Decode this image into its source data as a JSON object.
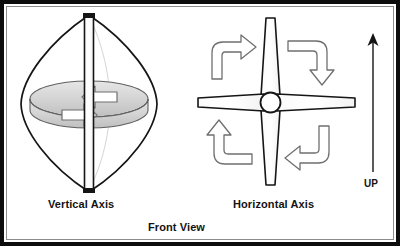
{
  "figure": {
    "background_color": "#ffffff",
    "frame_color": "#0d0d0d",
    "inner_rule_color": "#8d8d8d",
    "ink_color": "#131313",
    "arrow_outline_color": "#6f6f6f",
    "ring_fill_color": "#d4d4d4"
  },
  "labels": {
    "vertical_axis": "Vertical Axis",
    "horizontal_axis": "Horizontal Axis",
    "front_view": "Front View",
    "up": "UP"
  },
  "panels": {
    "left": {
      "name": "vertical-axis-turbine",
      "caption": "Vertical Axis",
      "turbine_type": "Darrieus vertical axis wind turbine",
      "blade_count": 2,
      "blade_shape": "curved lens / eggbeater",
      "has_mast": true,
      "rotation_indicator": "horizontal ring with two arrowheads",
      "rotation_direction": "about vertical mast"
    },
    "right": {
      "name": "horizontal-axis-turbine",
      "caption": "Horizontal Axis",
      "turbine_type": "Horizontal axis wind turbine",
      "blade_count": 4,
      "blade_shape": "tapered straight blades in a cross",
      "has_hub": true,
      "rotation_indicator": "four curved corner arrows",
      "rotation_direction": "clockwise"
    }
  },
  "direction_marker": {
    "name": "up-arrow",
    "label": "UP",
    "points": "up"
  },
  "icons": {
    "rotation_arrow": "curved-arrow-icon",
    "up_arrow": "arrow-up-icon",
    "hub": "hub-circle-icon"
  }
}
